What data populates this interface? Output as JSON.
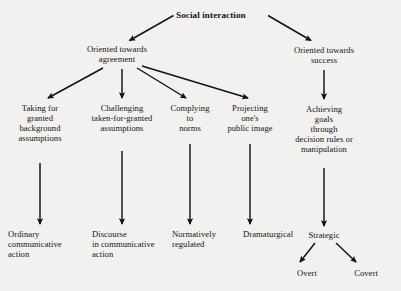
{
  "diagram": {
    "title": "Social interaction",
    "type": "hierarchical-tree",
    "nodes": {
      "root": "Social interaction",
      "branch_agreement": "Oriented towards\nagreement",
      "branch_success": "Oriented towards\nsuccess",
      "sub_taking": "Taking for\ngranted\nbackground\nassumptions",
      "sub_challenging": "Challenging\ntaken-for-granted\nassumptions",
      "sub_complying": "Complying\nto\nnorms",
      "sub_projecting": "Projecting\none's\npublic image",
      "sub_achieving": "Achieving\ngoals\nthrough\ndecision rules or\nmanipulation",
      "leaf_ordinary": "Ordinary\ncommunicative\naction",
      "leaf_discourse": "Discourse\nin communicative\naction",
      "leaf_normatively": "Normatively\nregulated",
      "leaf_dramaturgical": "Dramaturgical",
      "leaf_strategic": "Strategic",
      "leaf_overt": "Overt",
      "leaf_covert": "Covert"
    },
    "colors": {
      "background": "#f2f1ef",
      "text": "#16130f",
      "arrow": "#14110e"
    }
  }
}
